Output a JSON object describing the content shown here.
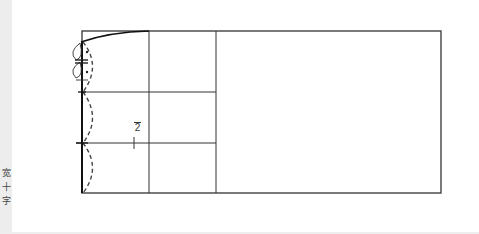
{
  "diagram": {
    "type": "pattern-draft",
    "colors": {
      "line": "#222222",
      "background": "#ffffff",
      "strip": "#ededed"
    },
    "frame": {
      "x": 82,
      "y": 31,
      "width": 359,
      "height": 162
    },
    "vertical_lines_x": [
      149,
      216
    ],
    "horizontal_lines_y": [
      92,
      143
    ],
    "label_fraction": {
      "numerator": "1",
      "denominator": "2",
      "text": "1/2"
    }
  },
  "side_strip": {
    "chars": [
      "宽",
      "十",
      "字"
    ]
  }
}
